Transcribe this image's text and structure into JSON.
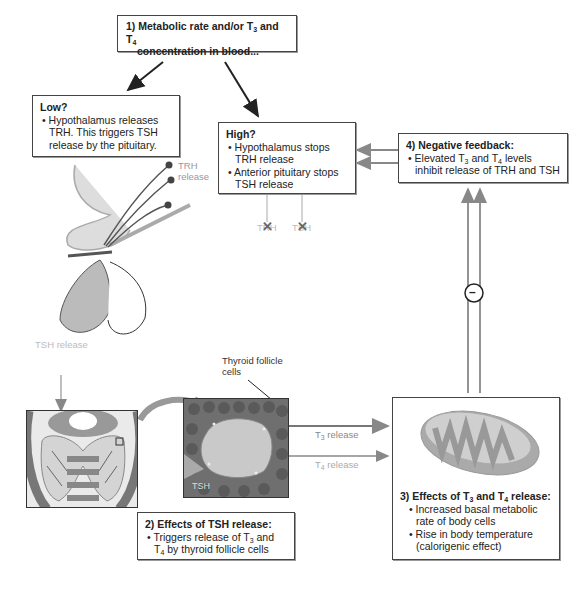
{
  "step1": {
    "title_prefix": "1) Metabolic rate and/or T",
    "sub3": "3",
    "and": " and T",
    "sub4": "4",
    "title_line2": "concentration in blood..."
  },
  "low": {
    "title": "Low?",
    "bullet": "• Hypothalamus releases TRH. This triggers TSH release by the pituitary."
  },
  "high": {
    "title": "High?",
    "bullets": [
      "• Hypothalamus stops TRH release",
      "• Anterior pituitary stops TSH release"
    ]
  },
  "step4": {
    "title": "4) Negative feedback:",
    "bullet_a": "• Elevated T",
    "sub3": "3",
    "bullet_b": " and T",
    "sub4": "4",
    "bullet_c": " levels inhibit release of TRH and TSH"
  },
  "step2": {
    "title": "2) Effects of TSH release:",
    "bullet_a": "• Triggers release of T",
    "sub3": "3",
    "bullet_b": " and T",
    "sub4": "4",
    "bullet_c": " by thyroid follicle cells"
  },
  "step3": {
    "title_a": "3) Effects of T",
    "sub3": "3",
    "title_b": " and T",
    "sub4": "4",
    "title_c": " release:",
    "bullets": [
      "• Increased basal metabolic rate of body cells",
      "• Rise in body temperature (calorigenic effect)"
    ]
  },
  "labels": {
    "trh_release_1": "TRH",
    "trh_release_2": "release",
    "tsh_release": "TSH release",
    "thyroid_follicle": "Thyroid follicle cells",
    "t3_release_a": "T",
    "t3_sub": "3",
    "t3_release_b": " release",
    "t4_release_a": "T",
    "t4_sub": "4",
    "t4_release_b": " release",
    "tsh_in_image": "TSH",
    "blocked_trh": "TRH",
    "blocked_tsh": "TSH",
    "negative_sign": "–"
  },
  "colors": {
    "border": "#444444",
    "arrow_dark": "#222222",
    "arrow_gray": "#888888",
    "label_gray": "#999999"
  }
}
